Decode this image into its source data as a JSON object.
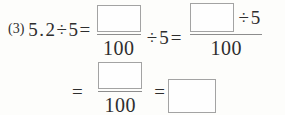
{
  "colors": {
    "background": "#fdfdfb",
    "text": "#2e2e2e",
    "box_border": "#a3a3a3",
    "fraction_bar": "#8d8d8d"
  },
  "problem": {
    "number": "(3)",
    "lead_expression": "5.2÷5=",
    "fraction1": {
      "numerator": "",
      "denominator": "100"
    },
    "middle_operator": "÷5=",
    "fraction2": {
      "numerator": "",
      "numerator_operator": "÷5",
      "denominator": "100"
    },
    "line2": {
      "equals1": "=",
      "fraction3": {
        "numerator": "",
        "denominator": "100"
      },
      "equals2": "="
    }
  }
}
